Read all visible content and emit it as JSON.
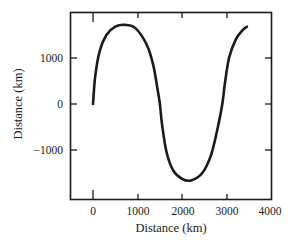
{
  "chart_data": {
    "type": "line",
    "title": "",
    "xlabel": "Distance (km)",
    "ylabel": "Distance (km)",
    "xlim": [
      -500,
      4000
    ],
    "ylim": [
      -2000,
      2000
    ],
    "xticks": [
      0,
      1000,
      2000,
      3000,
      4000
    ],
    "xtick_labels": [
      "0",
      "1000",
      "2000",
      "3000",
      "4000"
    ],
    "yticks": [
      1000,
      0,
      -1000
    ],
    "ytick_labels": [
      "1000",
      "0",
      "-1000"
    ],
    "grid": false,
    "legend": null,
    "series": [
      {
        "name": "path",
        "color": "#1a1a1a",
        "x": [
          0,
          50,
          150,
          300,
          500,
          720,
          950,
          1200,
          1350,
          1450,
          1500,
          1550,
          1650,
          1800,
          2000,
          2200,
          2450,
          2650,
          2800,
          2900,
          2950,
          3050,
          3200,
          3350,
          3450
        ],
        "y": [
          0,
          600,
          1150,
          1500,
          1680,
          1720,
          1650,
          1300,
          850,
          300,
          0,
          -450,
          -1050,
          -1450,
          -1630,
          -1660,
          -1500,
          -1100,
          -500,
          0,
          400,
          1000,
          1400,
          1600,
          1680
        ]
      }
    ]
  }
}
